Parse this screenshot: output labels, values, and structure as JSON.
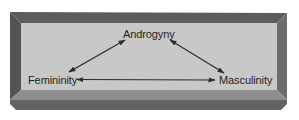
{
  "diagram": {
    "type": "triangle-relationship",
    "nodes": [
      {
        "id": "androgyny",
        "label": "Androgyny"
      },
      {
        "id": "femininity",
        "label": "Femininity"
      },
      {
        "id": "masculinity",
        "label": "Masculinity"
      }
    ],
    "edges": [
      {
        "from": "femininity",
        "to": "androgyny",
        "style": "double-headed-arrow"
      },
      {
        "from": "androgyny",
        "to": "masculinity",
        "style": "double-headed-arrow"
      },
      {
        "from": "femininity",
        "to": "masculinity",
        "style": "double-headed-arrow"
      }
    ]
  },
  "colors": {
    "background": "#ffffff",
    "panel": "#c8c8c8",
    "frame_top": "#5c5c5c",
    "frame_left": "#545454",
    "frame_right": "#6c6c6c",
    "bevel_light": "#8e8e8e",
    "bevel_dark": "#626262",
    "arrow": "#2a2a2a",
    "text": "#1e1e1e"
  }
}
